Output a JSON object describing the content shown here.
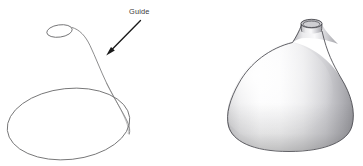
{
  "figure": {
    "background_color": "#ffffff",
    "width": 363,
    "height": 166
  },
  "annotations": {
    "guide_label": "Guide",
    "arrow_color": "#1a1a1a",
    "label_color": "#3a3a3c"
  },
  "left_panel": {
    "name": "wireframe-guide-diagram",
    "description": "Wireframe showing a small top ellipse, a large base ellipse, and the profile guide curve connecting them",
    "stroke_color": "#6e6e70",
    "shapes": {
      "top_ellipse": {
        "name": "top-rim-ellipse",
        "cx": 59.5,
        "cy": 31.0,
        "rx": 12.8,
        "ry": 6.2,
        "rotation": -8
      },
      "base_ellipse": {
        "name": "base-circle-ellipse",
        "cx": 68.5,
        "cy": 124.0,
        "rx": 61.5,
        "ry": 36.0,
        "rotation": -6
      },
      "guide_curve": {
        "name": "profile-guide-curve",
        "start": [
          71,
          27
        ],
        "end": [
          128,
          128
        ]
      }
    },
    "arrow": {
      "name": "guide-callout-arrow",
      "from": [
        141,
        21
      ],
      "to": [
        107,
        55
      ]
    },
    "label_position": [
      129,
      14
    ]
  },
  "right_panel": {
    "name": "shaded-vase-render",
    "description": "Shaded 3D render of the onion/vase surface of revolution produced by the guide curve",
    "outline_color": "#45454a",
    "shading": {
      "highlight_color": "#fdfdfd",
      "midtone_color": "#d8d8da",
      "shadow_color": "#9b9b9f",
      "deep_shadow_color": "#7e7e83",
      "rim_interior_color": "#b9b9bd"
    },
    "bounds": {
      "left": 224,
      "right": 356,
      "top": 17,
      "bottom": 152
    },
    "parts": {
      "body": "onion-bulb-body",
      "neck": "tapered-neck",
      "rim": "circular-rim-opening"
    }
  }
}
